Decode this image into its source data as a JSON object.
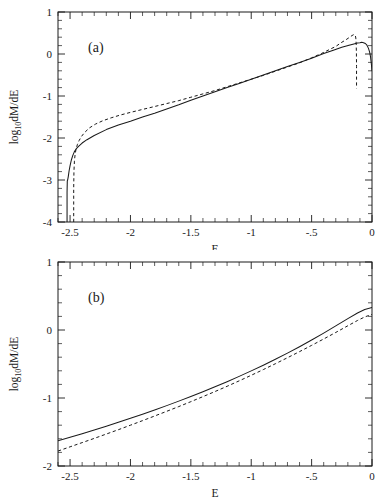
{
  "figure": {
    "panels": [
      {
        "tag": "(a)",
        "xlabel": "E",
        "ylabel": "log₁₀dM/dE",
        "xlim": [
          -2.6,
          0
        ],
        "ylim": [
          -4,
          1
        ],
        "xticks": [
          -2.5,
          -2,
          -1.5,
          -1,
          -0.5,
          0
        ],
        "xticklabels": [
          "-2.5",
          "-2",
          "-1.5",
          "-1",
          "-.5",
          "0"
        ],
        "yticks": [
          -4,
          -3,
          -2,
          -1,
          0,
          1
        ],
        "yticklabels": [
          "-4",
          "-3",
          "-2",
          "-1",
          "0",
          "1"
        ],
        "xminor_step": 0.1,
        "yminor_step": 0.2
      },
      {
        "tag": "(b)",
        "xlabel": "E",
        "ylabel": "log₁₀dM/dE",
        "xlim": [
          -2.6,
          0
        ],
        "ylim": [
          -2,
          1
        ],
        "xticks": [
          -2.5,
          -2,
          -1.5,
          -1,
          -0.5,
          0
        ],
        "xticklabels": [
          "-2.5",
          "-2",
          "-1.5",
          "-1",
          "-.5",
          "0"
        ],
        "yticks": [
          -2,
          -1,
          0,
          1
        ],
        "yticklabels": [
          "-2",
          "-1",
          "0",
          "1"
        ],
        "xminor_step": 0.1,
        "yminor_step": 0.2
      }
    ]
  },
  "chart_data": [
    {
      "type": "line",
      "panel": "(a)",
      "title": "",
      "xlabel": "E",
      "ylabel": "log10 dM/dE",
      "xlim": [
        -2.6,
        0
      ],
      "ylim": [
        -4,
        1
      ],
      "grid": false,
      "legend": "none",
      "series": [
        {
          "name": "solid",
          "style": "solid",
          "x": [
            -2.525,
            -2.525,
            -2.523,
            -2.52,
            -2.515,
            -2.508,
            -2.5,
            -2.49,
            -2.478,
            -2.465,
            -2.45,
            -2.43,
            -2.4,
            -2.36,
            -2.3,
            -2.2,
            -2.1,
            -2.0,
            -1.9,
            -1.8,
            -1.7,
            -1.6,
            -1.5,
            -1.4,
            -1.3,
            -1.2,
            -1.1,
            -1.0,
            -0.9,
            -0.8,
            -0.7,
            -0.6,
            -0.5,
            -0.4,
            -0.32,
            -0.25,
            -0.19,
            -0.15,
            -0.12,
            -0.1,
            -0.085,
            -0.07,
            -0.055,
            -0.042,
            -0.03,
            -0.02,
            -0.012,
            -0.006,
            0.0
          ],
          "y": [
            -4.0,
            -3.3,
            -3.02,
            -3.0,
            -2.92,
            -2.78,
            -2.66,
            -2.53,
            -2.42,
            -2.33,
            -2.26,
            -2.2,
            -2.12,
            -2.04,
            -1.94,
            -1.8,
            -1.69,
            -1.6,
            -1.5,
            -1.41,
            -1.31,
            -1.21,
            -1.1,
            -1.0,
            -0.9,
            -0.8,
            -0.7,
            -0.6,
            -0.5,
            -0.4,
            -0.3,
            -0.2,
            -0.1,
            0.01,
            0.09,
            0.16,
            0.21,
            0.24,
            0.26,
            0.27,
            0.28,
            0.27,
            0.25,
            0.21,
            0.14,
            0.05,
            -0.07,
            -0.22,
            -0.4
          ]
        },
        {
          "name": "dashed",
          "style": "dashed",
          "x": [
            -2.47,
            -2.47,
            -2.468,
            -2.464,
            -2.458,
            -2.45,
            -2.44,
            -2.425,
            -2.405,
            -2.38,
            -2.34,
            -2.29,
            -2.23,
            -2.16,
            -2.08,
            -2.0,
            -1.9,
            -1.8,
            -1.7,
            -1.6,
            -1.5,
            -1.4,
            -1.3,
            -1.2,
            -1.1,
            -1.0,
            -0.9,
            -0.8,
            -0.7,
            -0.6,
            -0.5,
            -0.42,
            -0.35,
            -0.3,
            -0.255,
            -0.215,
            -0.185,
            -0.165,
            -0.152,
            -0.143,
            -0.138,
            -0.134,
            -0.131,
            -0.129,
            -0.128,
            -0.128,
            -0.128
          ],
          "y": [
            -4.0,
            -3.2,
            -2.8,
            -2.55,
            -2.38,
            -2.26,
            -2.16,
            -2.06,
            -1.96,
            -1.87,
            -1.76,
            -1.67,
            -1.59,
            -1.52,
            -1.45,
            -1.39,
            -1.32,
            -1.25,
            -1.18,
            -1.11,
            -1.03,
            -0.95,
            -0.87,
            -0.78,
            -0.69,
            -0.6,
            -0.51,
            -0.41,
            -0.31,
            -0.21,
            -0.09,
            0.01,
            0.11,
            0.18,
            0.27,
            0.34,
            0.4,
            0.44,
            0.46,
            0.46,
            0.44,
            0.38,
            0.24,
            0.02,
            -0.3,
            -0.6,
            -0.82
          ]
        }
      ]
    },
    {
      "type": "line",
      "panel": "(b)",
      "title": "",
      "xlabel": "E",
      "ylabel": "log10 dM/dE",
      "xlim": [
        -2.6,
        0
      ],
      "ylim": [
        -2,
        1
      ],
      "grid": false,
      "legend": "none",
      "series": [
        {
          "name": "solid",
          "style": "solid",
          "x": [
            -2.6,
            -2.5,
            -2.4,
            -2.3,
            -2.2,
            -2.1,
            -2.0,
            -1.9,
            -1.8,
            -1.7,
            -1.6,
            -1.5,
            -1.4,
            -1.3,
            -1.2,
            -1.1,
            -1.0,
            -0.9,
            -0.8,
            -0.7,
            -0.6,
            -0.5,
            -0.4,
            -0.3,
            -0.2,
            -0.12,
            -0.06,
            0.0
          ],
          "y": [
            -1.63,
            -1.578,
            -1.524,
            -1.47,
            -1.414,
            -1.357,
            -1.298,
            -1.238,
            -1.176,
            -1.112,
            -1.046,
            -0.978,
            -0.908,
            -0.835,
            -0.76,
            -0.682,
            -0.601,
            -0.517,
            -0.43,
            -0.34,
            -0.246,
            -0.148,
            -0.046,
            0.06,
            0.168,
            0.25,
            0.3,
            0.33
          ]
        },
        {
          "name": "dashed",
          "style": "dashed",
          "x": [
            -2.6,
            -2.5,
            -2.4,
            -2.3,
            -2.2,
            -2.1,
            -2.0,
            -1.9,
            -1.8,
            -1.7,
            -1.6,
            -1.5,
            -1.4,
            -1.3,
            -1.2,
            -1.1,
            -1.0,
            -0.9,
            -0.8,
            -0.7,
            -0.6,
            -0.5,
            -0.4,
            -0.3,
            -0.2,
            -0.12,
            -0.06,
            0.0
          ],
          "y": [
            -1.78,
            -1.718,
            -1.656,
            -1.594,
            -1.53,
            -1.466,
            -1.4,
            -1.333,
            -1.265,
            -1.196,
            -1.126,
            -1.054,
            -0.98,
            -0.905,
            -0.828,
            -0.748,
            -0.666,
            -0.582,
            -0.496,
            -0.408,
            -0.318,
            -0.226,
            -0.132,
            -0.036,
            0.062,
            0.14,
            0.192,
            0.23
          ]
        }
      ]
    }
  ]
}
